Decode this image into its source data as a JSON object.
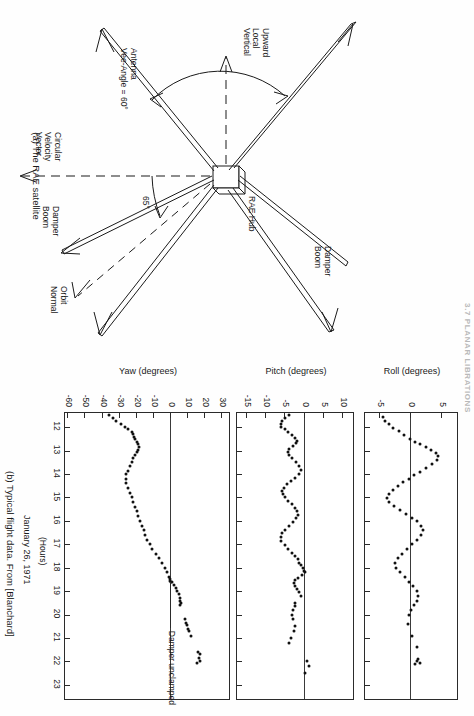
{
  "page": {
    "running_head": "3.7  PLANAR LIBRATIONS",
    "background": "#ffffff",
    "ink": "#111111"
  },
  "figure_a": {
    "caption": "(a)  The RAE satellite",
    "labels": {
      "hub": "RAE Hub",
      "damper_boom_upper": "Damper\nBoom",
      "damper_boom_lower": "Damper\nBoom",
      "upward_local_vertical": "Upward\nLocal\nVertical",
      "antenna_vee_angle": "Antenna\nVee-Angle = 60°",
      "circular_velocity_vector": "Circular\nVelocity\nVector",
      "orbit_normal": "Orbit\nNormal",
      "angle_65": "65°"
    }
  },
  "figure_b": {
    "caption": "(b)  Typical flight data.  From [Blanchard]",
    "date_label": "January 26, 1971",
    "xaxis_unit": "(Hours)",
    "annotation": "Damper unclamped",
    "xaxis": {
      "ticks": [
        12,
        13,
        14,
        15,
        16,
        17,
        18,
        19,
        20,
        21,
        22,
        23
      ],
      "min": 11.4,
      "max": 23.6
    }
  },
  "chart_data": [
    {
      "type": "scatter",
      "title": "Roll",
      "ylabel": "Roll (degrees)",
      "xlabel": "(Hours)",
      "yticks": [
        5,
        0,
        -5
      ],
      "ylim": [
        -7.5,
        7.5
      ],
      "xlim": [
        11.4,
        23.6
      ],
      "grid": false,
      "zero_line": 0,
      "points": [
        [
          11.55,
          -4.6
        ],
        [
          11.72,
          -4.2
        ],
        [
          11.88,
          -3.6
        ],
        [
          12.02,
          -2.9
        ],
        [
          12.18,
          -2.0
        ],
        [
          12.34,
          -1.1
        ],
        [
          12.5,
          -0.2
        ],
        [
          12.62,
          0.6
        ],
        [
          12.74,
          1.5
        ],
        [
          12.86,
          2.4
        ],
        [
          12.98,
          3.3
        ],
        [
          13.1,
          4.0
        ],
        [
          13.25,
          4.4
        ],
        [
          13.42,
          4.2
        ],
        [
          13.58,
          3.4
        ],
        [
          13.74,
          2.4
        ],
        [
          13.9,
          1.4
        ],
        [
          14.05,
          0.5
        ],
        [
          14.2,
          -0.4
        ],
        [
          14.36,
          -1.3
        ],
        [
          14.52,
          -2.2
        ],
        [
          14.68,
          -3.0
        ],
        [
          14.85,
          -3.6
        ],
        [
          15.02,
          -3.9
        ],
        [
          15.2,
          -3.6
        ],
        [
          15.37,
          -2.8
        ],
        [
          15.54,
          -1.8
        ],
        [
          15.7,
          -0.8
        ],
        [
          15.86,
          0.1
        ],
        [
          16.02,
          0.9
        ],
        [
          16.2,
          1.6
        ],
        [
          16.4,
          1.9
        ],
        [
          16.6,
          1.6
        ],
        [
          16.8,
          1.0
        ],
        [
          17.0,
          0.2
        ],
        [
          17.2,
          -0.7
        ],
        [
          17.4,
          -1.5
        ],
        [
          17.6,
          -2.2
        ],
        [
          17.8,
          -2.6
        ],
        [
          18.0,
          -2.4
        ],
        [
          18.2,
          -1.8
        ],
        [
          18.4,
          -1.0
        ],
        [
          18.6,
          -0.3
        ],
        [
          18.8,
          0.4
        ],
        [
          19.0,
          0.9
        ],
        [
          19.2,
          1.1
        ],
        [
          19.4,
          0.9
        ],
        [
          19.6,
          0.5
        ],
        [
          19.8,
          0.0
        ],
        [
          20.0,
          -0.4
        ],
        [
          20.4,
          -0.5
        ],
        [
          20.9,
          0.2
        ],
        [
          21.4,
          0.9
        ],
        [
          21.9,
          1.2
        ],
        [
          22.0,
          0.9
        ],
        [
          22.05,
          1.4
        ],
        [
          22.1,
          0.7
        ]
      ]
    },
    {
      "type": "scatter",
      "title": "Pitch",
      "ylabel": "Pitch (degrees)",
      "xlabel": "(Hours)",
      "yticks": [
        10,
        5,
        0,
        -5,
        -10,
        -15
      ],
      "ylim": [
        -17.5,
        12.5
      ],
      "xlim": [
        11.4,
        23.6
      ],
      "grid": false,
      "zero_line": 0,
      "points": [
        [
          11.5,
          -4.0
        ],
        [
          11.62,
          -5.0
        ],
        [
          11.74,
          -5.8
        ],
        [
          11.86,
          -6.2
        ],
        [
          11.98,
          -6.0
        ],
        [
          12.1,
          -5.2
        ],
        [
          12.22,
          -4.2
        ],
        [
          12.34,
          -3.2
        ],
        [
          12.46,
          -2.4
        ],
        [
          12.58,
          -2.0
        ],
        [
          12.7,
          -2.2
        ],
        [
          12.82,
          -3.0
        ],
        [
          12.94,
          -4.0
        ],
        [
          13.06,
          -4.4
        ],
        [
          13.2,
          -4.0
        ],
        [
          13.34,
          -3.2
        ],
        [
          13.5,
          -2.2
        ],
        [
          13.66,
          -1.4
        ],
        [
          13.82,
          -1.0
        ],
        [
          14.0,
          -1.4
        ],
        [
          14.16,
          -2.4
        ],
        [
          14.3,
          -3.6
        ],
        [
          14.44,
          -4.6
        ],
        [
          14.58,
          -5.4
        ],
        [
          14.72,
          -5.8
        ],
        [
          14.86,
          -5.6
        ],
        [
          15.0,
          -5.0
        ],
        [
          15.16,
          -4.2
        ],
        [
          15.3,
          -3.4
        ],
        [
          15.44,
          -2.6
        ],
        [
          15.58,
          -2.0
        ],
        [
          15.74,
          -1.8
        ],
        [
          15.9,
          -2.2
        ],
        [
          16.06,
          -3.0
        ],
        [
          16.22,
          -4.0
        ],
        [
          16.38,
          -5.0
        ],
        [
          16.54,
          -5.8
        ],
        [
          16.7,
          -6.2
        ],
        [
          16.86,
          -6.0
        ],
        [
          17.02,
          -5.2
        ],
        [
          17.2,
          -4.2
        ],
        [
          17.36,
          -3.2
        ],
        [
          17.5,
          -2.4
        ],
        [
          17.64,
          -1.8
        ],
        [
          17.78,
          -1.4
        ],
        [
          17.9,
          -1.0
        ],
        [
          18.0,
          -0.5
        ],
        [
          18.12,
          -0.2
        ],
        [
          18.2,
          0.2
        ],
        [
          18.3,
          -0.6
        ],
        [
          18.42,
          -1.6
        ],
        [
          18.54,
          -2.4
        ],
        [
          18.66,
          -2.8
        ],
        [
          18.78,
          -2.6
        ],
        [
          18.9,
          -2.0
        ],
        [
          19.04,
          -1.4
        ],
        [
          19.2,
          -0.9
        ],
        [
          19.5,
          -2.4
        ],
        [
          19.62,
          -2.6
        ],
        [
          19.8,
          -3.0
        ],
        [
          20.0,
          -3.4
        ],
        [
          20.2,
          -3.0
        ],
        [
          20.5,
          -2.6
        ],
        [
          20.7,
          -2.8
        ],
        [
          21.0,
          -3.6
        ],
        [
          21.2,
          -4.0
        ],
        [
          22.0,
          0.6
        ],
        [
          22.2,
          1.2
        ],
        [
          22.5,
          0.2
        ]
      ]
    },
    {
      "type": "scatter",
      "title": "Yaw",
      "ylabel": "Yaw (degrees)",
      "xlabel": "(Hours)",
      "yticks": [
        30,
        20,
        10,
        0,
        -10,
        -20,
        -30,
        -40,
        -50,
        -60
      ],
      "ylim": [
        -62,
        34
      ],
      "xlim": [
        11.4,
        23.6
      ],
      "grid": false,
      "zero_line": 0,
      "annotation": {
        "text": "Damper unclamped",
        "x": 18.6,
        "y": 0
      },
      "points": [
        [
          11.5,
          -36
        ],
        [
          11.62,
          -34
        ],
        [
          11.74,
          -32
        ],
        [
          11.86,
          -29
        ],
        [
          11.98,
          -27
        ],
        [
          12.1,
          -25
        ],
        [
          12.2,
          -23
        ],
        [
          12.3,
          -22
        ],
        [
          12.42,
          -21.5
        ],
        [
          12.52,
          -21
        ],
        [
          12.62,
          -20
        ],
        [
          12.74,
          -19
        ],
        [
          12.86,
          -18.5
        ],
        [
          12.96,
          -19
        ],
        [
          13.08,
          -20
        ],
        [
          13.2,
          -21
        ],
        [
          13.34,
          -22
        ],
        [
          13.5,
          -23
        ],
        [
          13.68,
          -24
        ],
        [
          13.86,
          -25
        ],
        [
          14.02,
          -26
        ],
        [
          14.2,
          -26.5
        ],
        [
          14.4,
          -26
        ],
        [
          14.6,
          -25
        ],
        [
          14.8,
          -24
        ],
        [
          15.0,
          -23
        ],
        [
          15.2,
          -22
        ],
        [
          15.4,
          -21
        ],
        [
          15.6,
          -20
        ],
        [
          15.8,
          -19
        ],
        [
          16.0,
          -18
        ],
        [
          16.2,
          -17
        ],
        [
          16.4,
          -16
        ],
        [
          16.6,
          -15
        ],
        [
          16.8,
          -14
        ],
        [
          17.0,
          -12.5
        ],
        [
          17.2,
          -11
        ],
        [
          17.4,
          -9
        ],
        [
          17.6,
          -7
        ],
        [
          17.8,
          -5
        ],
        [
          18.0,
          -3.5
        ],
        [
          18.2,
          -2.2
        ],
        [
          18.38,
          -1.2
        ],
        [
          18.5,
          -0.5
        ],
        [
          18.6,
          0.0
        ],
        [
          18.62,
          0.4
        ],
        [
          18.56,
          -0.6
        ],
        [
          18.74,
          1.6
        ],
        [
          18.86,
          2.8
        ],
        [
          19.0,
          3.8
        ],
        [
          19.14,
          4.6
        ],
        [
          19.28,
          5.2
        ],
        [
          19.4,
          5.6
        ],
        [
          19.5,
          5.8
        ],
        [
          19.6,
          5.6
        ],
        [
          20.2,
          8.0
        ],
        [
          20.34,
          9.0
        ],
        [
          20.46,
          9.6
        ],
        [
          20.6,
          10.0
        ],
        [
          20.72,
          10.8
        ],
        [
          20.9,
          11.8
        ],
        [
          21.6,
          16.0
        ],
        [
          21.7,
          17.2
        ],
        [
          21.84,
          16.2
        ],
        [
          21.96,
          17.0
        ],
        [
          22.05,
          15.0
        ]
      ]
    }
  ]
}
